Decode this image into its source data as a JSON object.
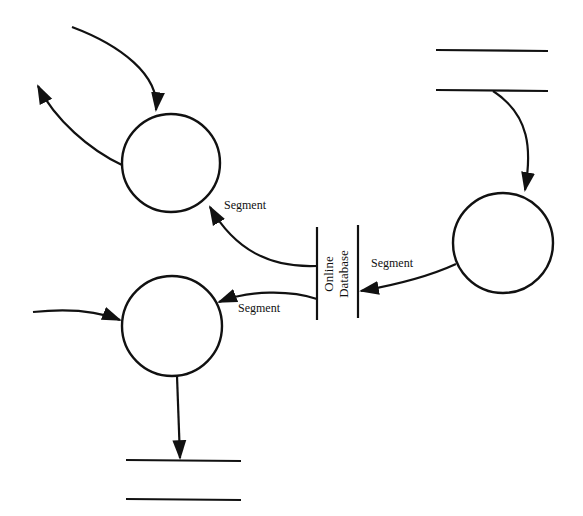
{
  "diagram": {
    "type": "data-flow-diagram",
    "background": "#ffffff",
    "ink_color": "#111111",
    "processes": [
      {
        "id": "process-top-left",
        "label": ""
      },
      {
        "id": "process-right",
        "label": ""
      },
      {
        "id": "process-bottom-left",
        "label": ""
      }
    ],
    "data_stores": [
      {
        "id": "store-top-right",
        "label": ""
      },
      {
        "id": "store-bottom",
        "label": ""
      },
      {
        "id": "online-database",
        "label_line1": "Online",
        "label_line2": "Database"
      }
    ],
    "flows": [
      {
        "from": "external",
        "to": "process-top-left",
        "label": ""
      },
      {
        "from": "process-top-left",
        "to": "external",
        "label": ""
      },
      {
        "from": "online-database",
        "to": "process-top-left",
        "label": "Segment"
      },
      {
        "from": "store-top-right",
        "to": "process-right",
        "label": ""
      },
      {
        "from": "process-right",
        "to": "online-database",
        "label": "Segment"
      },
      {
        "from": "online-database",
        "to": "process-bottom-left",
        "label": "Segment"
      },
      {
        "from": "external",
        "to": "process-bottom-left",
        "label": ""
      },
      {
        "from": "process-bottom-left",
        "to": "store-bottom",
        "label": ""
      }
    ]
  }
}
